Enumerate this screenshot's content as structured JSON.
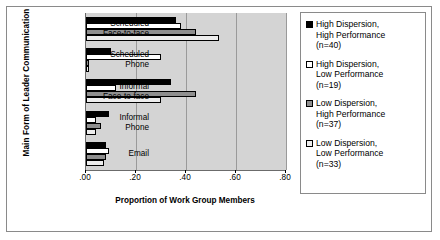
{
  "chart_data": {
    "type": "bar",
    "orientation": "horizontal",
    "title": "",
    "xlabel": "Proportion of Work Group Members",
    "ylabel": "Main Form of Leader Communication",
    "categories": [
      "Scheduled\nFace-to-face",
      "Scheduled\nPhone",
      "Informal\nFace-to-face",
      "Informal\nPhone",
      "Email"
    ],
    "xlim": [
      0.0,
      0.8
    ],
    "xticks": [
      0.0,
      0.2,
      0.4,
      0.6,
      0.8
    ],
    "xticklabels": [
      ".00",
      ".20",
      ".40",
      ".60",
      ".80"
    ],
    "grid": true,
    "legend_position": "right",
    "series": [
      {
        "name": "High Dispersion,\nHigh Performance\n(n=40)",
        "color": "#000000",
        "values": [
          0.36,
          0.1,
          0.34,
          0.09,
          0.08
        ]
      },
      {
        "name": "High Dispersion,\nLow Performance\n(n=19)",
        "color": "#ffffff",
        "values": [
          0.38,
          0.3,
          0.12,
          0.04,
          0.09
        ]
      },
      {
        "name": "Low Dispersion,\nHigh Performance\n(n=37)",
        "color": "#8f8f8f",
        "values": [
          0.44,
          0.01,
          0.44,
          0.06,
          0.08
        ]
      },
      {
        "name": "Low Dispersion,\nLow Performance\n(n=33)",
        "color": "#ededed",
        "values": [
          0.53,
          0.01,
          0.3,
          0.04,
          0.07
        ]
      }
    ]
  }
}
